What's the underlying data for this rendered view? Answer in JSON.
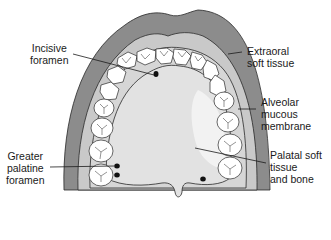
{
  "diagram": {
    "colors": {
      "extraoral": "#8c8c8c",
      "alveolar": "#c9c9c9",
      "palate": "#e2e2e2",
      "palate_highlight": "#f2f2f2",
      "teeth": "#ffffff",
      "outline": "#2a2a2a",
      "foramen": "#111111"
    },
    "labels": [
      {
        "id": "incisive-foramen",
        "text": "Incisive\nforamen"
      },
      {
        "id": "extraoral-soft-tissue",
        "text": "Extraoral\nsoft tissue"
      },
      {
        "id": "alveolar-mucous-membrane",
        "text": "Alveolar\nmucous\nmembrane"
      },
      {
        "id": "greater-palatine-foramen",
        "text": "Greater\npalatine\nforamen"
      },
      {
        "id": "palatal-soft-tissue-and-bone",
        "text": "Palatal soft\ntissue\nand bone"
      }
    ]
  }
}
